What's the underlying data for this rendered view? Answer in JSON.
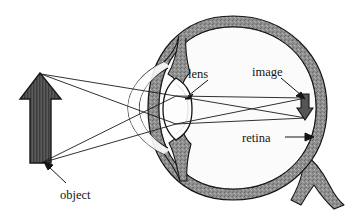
{
  "figure": {
    "background_color": "#ffffff",
    "ink_color": "#151515"
  },
  "labels": {
    "lens": "lens",
    "image": "image",
    "retina": "retina",
    "object": "object"
  },
  "colors": {
    "object_arrow_fill": "#4a4a4a",
    "image_arrow_fill": "#555555",
    "sclera_fill": "#8a8a8a",
    "vitreous_fill": "#fbfbfb",
    "outline": "#151515",
    "ray_color": "#1a1a1a"
  },
  "parts": {
    "object_arrow": "upright-thick-arrow",
    "image_arrow": "inverted-small-arrow",
    "eyeball": "sclera-ring",
    "cornea": "anterior-bulge",
    "lens_body": "biconvex-lens",
    "iris": "iris-pair",
    "optic_nerve": "forked-nerve"
  },
  "rays": {
    "count": 4,
    "description": "two rays from object tip and two from object base converging through the lens and crossing to form the inverted image on the retina"
  }
}
